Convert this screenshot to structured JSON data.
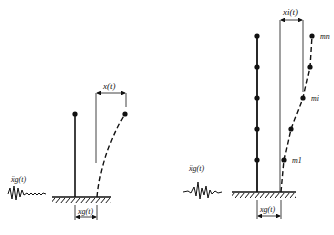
{
  "colors": {
    "ink": "#111111",
    "background": "#ffffff"
  },
  "left_figure": {
    "title": "single-degree-of-freedom system",
    "ground_accel_label": "ẍg(t)",
    "ground_disp_label": "xg(t)",
    "relative_disp_label": "x(t)"
  },
  "right_figure": {
    "title": "multi-degree-of-freedom system",
    "ground_accel_label": "ẍg(t)",
    "ground_disp_label": "xg(t)",
    "relative_disp_label": "xi(t)",
    "mass_labels": {
      "top": "mn",
      "middle": "mi",
      "bottom": "m1"
    }
  }
}
